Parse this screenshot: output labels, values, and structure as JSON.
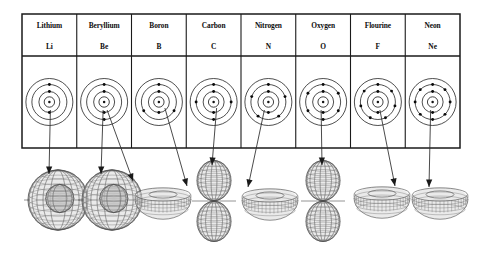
{
  "figure": {
    "background_color": "#ffffff",
    "ink_color": "#141414"
  },
  "table": {
    "x": 22,
    "y": 14,
    "width": 438,
    "height": 134,
    "header_row_height": 42,
    "border_color": "#1a1a1a",
    "columns": [
      {
        "name": "Lithium",
        "symbol": "Li",
        "atomic_number": 3,
        "shells": [
          2,
          1
        ],
        "orbital": {
          "shape": "sphere",
          "label": "s-orbital"
        },
        "pointer_count": 1
      },
      {
        "name": "Beryllium",
        "symbol": "Be",
        "atomic_number": 4,
        "shells": [
          2,
          2
        ],
        "orbital": {
          "shape": "sphere",
          "label": "s-orbital"
        },
        "pointer_count": 2
      },
      {
        "name": "Boron",
        "symbol": "B",
        "atomic_number": 5,
        "shells": [
          2,
          3
        ],
        "orbital": {
          "shape": "torus",
          "label": "p-orbital ring"
        },
        "pointer_count": 1
      },
      {
        "name": "Carbon",
        "symbol": "C",
        "atomic_number": 6,
        "shells": [
          2,
          4
        ],
        "orbital": {
          "shape": "dumbbell",
          "label": "p-orbital"
        },
        "pointer_count": 1
      },
      {
        "name": "Nitrogen",
        "symbol": "N",
        "atomic_number": 7,
        "shells": [
          2,
          5
        ],
        "orbital": {
          "shape": "torus",
          "label": "p-orbital ring"
        },
        "pointer_count": 1
      },
      {
        "name": "Oxygen",
        "symbol": "O",
        "atomic_number": 8,
        "shells": [
          2,
          6
        ],
        "orbital": {
          "shape": "dumbbell",
          "label": "p-orbital"
        },
        "pointer_count": 1
      },
      {
        "name": "Flourine",
        "symbol": "F",
        "atomic_number": 9,
        "shells": [
          2,
          7
        ],
        "orbital": {
          "shape": "torus",
          "label": "p-orbital ring"
        },
        "pointer_count": 1
      },
      {
        "name": "Neon",
        "symbol": "Ne",
        "atomic_number": 10,
        "shells": [
          2,
          8
        ],
        "orbital": {
          "shape": "torus",
          "label": "p-orbital ring"
        },
        "pointer_count": 1
      }
    ]
  },
  "orbital_row": {
    "y_center": 200,
    "shapes": [
      {
        "index": 0,
        "shape": "sphere",
        "cx": 58,
        "cy": 200,
        "rx": 30,
        "ry": 30
      },
      {
        "index": 1,
        "shape": "sphere",
        "cx": 112,
        "cy": 200,
        "rx": 30,
        "ry": 30
      },
      {
        "index": 2,
        "shape": "torus",
        "cx": 163,
        "cy": 199,
        "rx": 28,
        "ry": 15
      },
      {
        "index": 3,
        "shape": "dumbbell",
        "cx": 214,
        "cy": 201,
        "rx": 17,
        "ry": 20
      },
      {
        "index": 4,
        "shape": "torus",
        "cx": 270,
        "cy": 200,
        "rx": 28,
        "ry": 15
      },
      {
        "index": 5,
        "shape": "dumbbell",
        "cx": 323,
        "cy": 201,
        "rx": 17,
        "ry": 20
      },
      {
        "index": 6,
        "shape": "torus",
        "cx": 382,
        "cy": 198,
        "rx": 28,
        "ry": 15
      },
      {
        "index": 7,
        "shape": "torus",
        "cx": 440,
        "cy": 199,
        "rx": 28,
        "ry": 15
      }
    ]
  }
}
